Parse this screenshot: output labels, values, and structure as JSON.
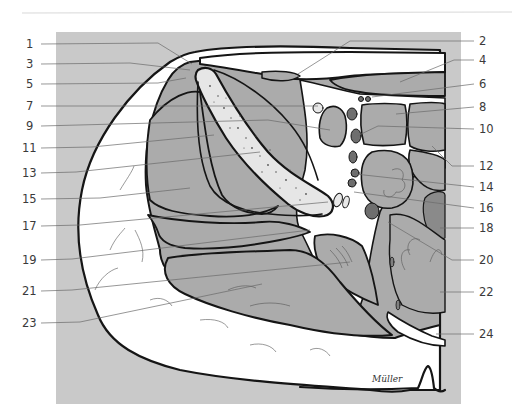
{
  "figure": {
    "type": "anatomical cross-section illustration",
    "signature": "Müller",
    "colors": {
      "background": "#ffffff",
      "panel": "#c9c9c9",
      "muscle": "#ababab",
      "fat": "#ffffff",
      "bone": "#e6e6e6",
      "vessel": "#6e6e6e",
      "dark_vessel": "#808080",
      "outline": "#151515",
      "leader": "#6a6a6a",
      "label_text": "#3a3a3a",
      "rule": "#d8d8d8"
    },
    "labels_left": [
      {
        "num": "1",
        "y": 44
      },
      {
        "num": "3",
        "y": 64
      },
      {
        "num": "5",
        "y": 84
      },
      {
        "num": "7",
        "y": 106
      },
      {
        "num": "9",
        "y": 126
      },
      {
        "num": "11",
        "y": 148
      },
      {
        "num": "13",
        "y": 173
      },
      {
        "num": "15",
        "y": 199
      },
      {
        "num": "17",
        "y": 226
      },
      {
        "num": "19",
        "y": 260
      },
      {
        "num": "21",
        "y": 291
      },
      {
        "num": "23",
        "y": 323
      }
    ],
    "labels_right": [
      {
        "num": "2",
        "y": 41
      },
      {
        "num": "4",
        "y": 60
      },
      {
        "num": "6",
        "y": 84
      },
      {
        "num": "8",
        "y": 107
      },
      {
        "num": "10",
        "y": 129
      },
      {
        "num": "12",
        "y": 166
      },
      {
        "num": "14",
        "y": 187
      },
      {
        "num": "16",
        "y": 208
      },
      {
        "num": "18",
        "y": 228
      },
      {
        "num": "20",
        "y": 260
      },
      {
        "num": "22",
        "y": 292
      },
      {
        "num": "24",
        "y": 334
      }
    ]
  }
}
